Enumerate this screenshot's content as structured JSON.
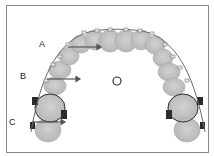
{
  "figure": {
    "labels": [
      {
        "id": "A",
        "text": "A"
      },
      {
        "id": "B",
        "text": "B"
      },
      {
        "id": "C",
        "text": "C"
      }
    ],
    "center_marker": "O",
    "colors": {
      "border": "#8a8a8a",
      "tooth": "#c4c4c4",
      "tooth_edge": "#a8a8a8",
      "wire": "#6a6a6a",
      "arrow": "#555555",
      "band": "#2a2a2a"
    }
  }
}
